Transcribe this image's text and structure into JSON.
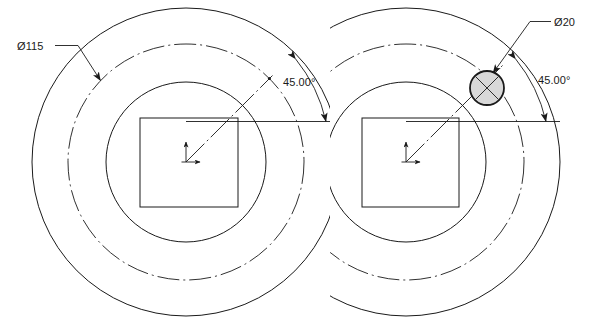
{
  "drawing": {
    "title": "Bolt circle hole pattern detail",
    "background_color": "#ffffff",
    "line_color": "#1a1a1a",
    "hole_fill_color": "#d8d8d8",
    "views": [
      {
        "id": "left-view",
        "name": "full-bolt-circle-view",
        "center": {
          "x": 186,
          "y": 162
        },
        "square": {
          "x": 140,
          "y": 118,
          "width": 98,
          "height": 89
        },
        "circles": [
          {
            "name": "outer-circle",
            "radius": 154,
            "style": "solid"
          },
          {
            "name": "bolt-circle",
            "radius": 118,
            "style": "dash-dot"
          },
          {
            "name": "inner-circle",
            "radius": 80,
            "style": "solid"
          }
        ],
        "labels": {
          "diameter": "Ø115",
          "angle": "45.00°"
        }
      },
      {
        "id": "right-view",
        "name": "hole-detail-view",
        "center": {
          "x": 406,
          "y": 162
        },
        "square": {
          "x": 362,
          "y": 118,
          "width": 97,
          "height": 89
        },
        "circles": [
          {
            "name": "outer-circle",
            "radius": 154,
            "style": "solid"
          },
          {
            "name": "bolt-circle",
            "radius": 118,
            "style": "dash-dot"
          },
          {
            "name": "inner-circle",
            "radius": 80,
            "style": "solid"
          }
        ],
        "hole": {
          "name": "bolt-hole",
          "center": {
            "x": 487,
            "y": 88
          },
          "radius": 17,
          "fill": "#d8d8d8"
        },
        "labels": {
          "diameter": "Ø20",
          "angle": "45.00°"
        }
      }
    ],
    "annotations": {
      "left_diameter_label": "Ø115",
      "left_angle_label": "45.00°",
      "right_diameter_label": "Ø20",
      "right_angle_label": "45.00°"
    }
  }
}
